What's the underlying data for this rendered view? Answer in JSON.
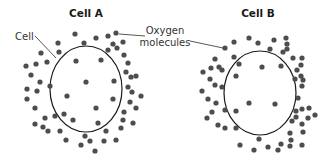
{
  "colors": {
    "background": "#ffffff",
    "molecule": "#4d4d4d",
    "membrane": "#1a1a1a",
    "text": "#1a1a1a",
    "label": "#333333"
  },
  "labels": {
    "cell_a_title": "Cell A",
    "cell_b_title": "Cell B",
    "cell_label": "Cell",
    "oxygen_label_line1": "Oxygen",
    "oxygen_label_line2": "molecules"
  },
  "cells": [
    {
      "name": "Cell A",
      "membrane": {
        "cx": 86,
        "cy": 89,
        "rx": 36,
        "ry": 43
      },
      "molecules_inside": [
        [
          76,
          61
        ],
        [
          101,
          60
        ],
        [
          86,
          82
        ],
        [
          114,
          81
        ],
        [
          67,
          96
        ],
        [
          113,
          99
        ],
        [
          96,
          108
        ],
        [
          73,
          120
        ],
        [
          98,
          123
        ]
      ],
      "molecules_outside": [
        [
          58,
          43
        ],
        [
          75,
          34
        ],
        [
          84,
          43
        ],
        [
          96,
          38
        ],
        [
          108,
          36
        ],
        [
          116,
          33
        ],
        [
          113,
          44
        ],
        [
          123,
          42
        ],
        [
          108,
          50
        ],
        [
          117,
          48
        ],
        [
          41,
          53
        ],
        [
          59,
          52
        ],
        [
          124,
          55
        ],
        [
          128,
          63
        ],
        [
          26,
          66
        ],
        [
          36,
          64
        ],
        [
          47,
          62
        ],
        [
          126,
          72
        ],
        [
          131,
          77
        ],
        [
          136,
          76
        ],
        [
          31,
          75
        ],
        [
          40,
          82
        ],
        [
          50,
          86
        ],
        [
          128,
          87
        ],
        [
          132,
          92
        ],
        [
          141,
          96
        ],
        [
          27,
          89
        ],
        [
          37,
          91
        ],
        [
          27,
          99
        ],
        [
          35,
          108
        ],
        [
          130,
          102
        ],
        [
          136,
          108
        ],
        [
          45,
          118
        ],
        [
          55,
          116
        ],
        [
          64,
          114
        ],
        [
          124,
          112
        ],
        [
          123,
          120
        ],
        [
          133,
          123
        ],
        [
          35,
          124
        ],
        [
          43,
          127
        ],
        [
          48,
          131
        ],
        [
          60,
          131
        ],
        [
          85,
          136
        ],
        [
          106,
          131
        ],
        [
          121,
          128
        ],
        [
          66,
          140
        ],
        [
          81,
          145
        ],
        [
          90,
          141
        ],
        [
          104,
          141
        ],
        [
          116,
          140
        ],
        [
          95,
          151
        ]
      ]
    },
    {
      "name": "Cell B",
      "membrane": {
        "cx": 260,
        "cy": 93,
        "rx": 36,
        "ry": 42
      },
      "molecules_inside": [
        [
          234,
          57
        ],
        [
          262,
          67
        ],
        [
          281,
          66
        ],
        [
          236,
          76
        ],
        [
          249,
          103
        ],
        [
          275,
          104
        ]
      ],
      "molecules_outside": [
        [
          225,
          48
        ],
        [
          234,
          42
        ],
        [
          249,
          38
        ],
        [
          258,
          43
        ],
        [
          274,
          40
        ],
        [
          286,
          38
        ],
        [
          287,
          44
        ],
        [
          270,
          49
        ],
        [
          283,
          52
        ],
        [
          287,
          49
        ],
        [
          215,
          59
        ],
        [
          211,
          68
        ],
        [
          219,
          67
        ],
        [
          222,
          70
        ],
        [
          239,
          64
        ],
        [
          293,
          58
        ],
        [
          302,
          58
        ],
        [
          301,
          65
        ],
        [
          297,
          70
        ],
        [
          301,
          76
        ],
        [
          303,
          80
        ],
        [
          295,
          79
        ],
        [
          302,
          86
        ],
        [
          203,
          72
        ],
        [
          210,
          79
        ],
        [
          215,
          85
        ],
        [
          222,
          87
        ],
        [
          202,
          91
        ],
        [
          208,
          99
        ],
        [
          216,
          103
        ],
        [
          212,
          112
        ],
        [
          225,
          110
        ],
        [
          236,
          111
        ],
        [
          207,
          118
        ],
        [
          218,
          125
        ],
        [
          225,
          128
        ],
        [
          236,
          128
        ],
        [
          298,
          98
        ],
        [
          296,
          111
        ],
        [
          296,
          117
        ],
        [
          292,
          121
        ],
        [
          302,
          109
        ],
        [
          309,
          108
        ],
        [
          308,
          118
        ],
        [
          315,
          115
        ],
        [
          240,
          145
        ],
        [
          254,
          150
        ],
        [
          268,
          147
        ],
        [
          259,
          139
        ],
        [
          278,
          150
        ],
        [
          281,
          144
        ],
        [
          290,
          146
        ],
        [
          291,
          140
        ],
        [
          302,
          145
        ],
        [
          303,
          132
        ],
        [
          290,
          133
        ],
        [
          302,
          124
        ]
      ]
    }
  ]
}
